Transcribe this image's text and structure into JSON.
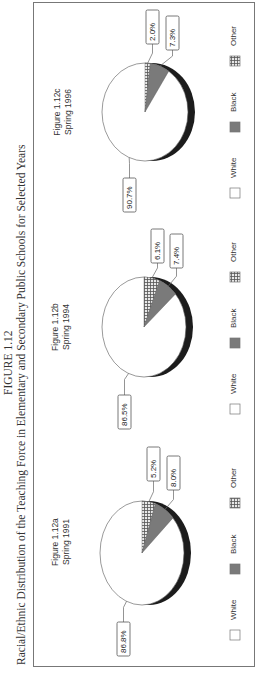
{
  "figure": {
    "label": "FIGURE 1.12",
    "title": "Racial/Ethnic Distribution of the Teaching Force in Elementary and Secondary Public Schools for Selected Years"
  },
  "legend": {
    "items": [
      {
        "label": "White",
        "pattern": "white",
        "color": "#ffffff"
      },
      {
        "label": "Black",
        "pattern": "gray",
        "color": "#7a7a7a"
      },
      {
        "label": "Other",
        "pattern": "crosshatch",
        "color": "#9a9a9a"
      }
    ]
  },
  "panels": [
    {
      "figure": "Figure 1.12a",
      "period": "Spring 1991",
      "labels": {
        "White": "86.8%",
        "Black": "8.0%",
        "Other": "5.2%"
      }
    },
    {
      "figure": "Figure 1.12b",
      "period": "Spring 1994",
      "labels": {
        "White": "86.5%",
        "Black": "7.4%",
        "Other": "6.1%"
      }
    },
    {
      "figure": "Figure 1.12c",
      "period": "Spring 1996",
      "labels": {
        "White": "90.7%",
        "Black": "7.3%",
        "Other": "2.0%"
      }
    }
  ],
  "chart_data": [
    {
      "type": "pie",
      "title": "Figure 1.12a Spring 1991",
      "categories": [
        "White",
        "Black",
        "Other"
      ],
      "values": [
        86.8,
        8.0,
        5.2
      ],
      "legend_position": "bottom"
    },
    {
      "type": "pie",
      "title": "Figure 1.12b Spring 1994",
      "categories": [
        "White",
        "Black",
        "Other"
      ],
      "values": [
        86.5,
        7.4,
        6.1
      ],
      "legend_position": "bottom"
    },
    {
      "type": "pie",
      "title": "Figure 1.12c Spring 1996",
      "categories": [
        "White",
        "Black",
        "Other"
      ],
      "values": [
        90.7,
        7.3,
        2.0
      ],
      "legend_position": "bottom"
    }
  ]
}
